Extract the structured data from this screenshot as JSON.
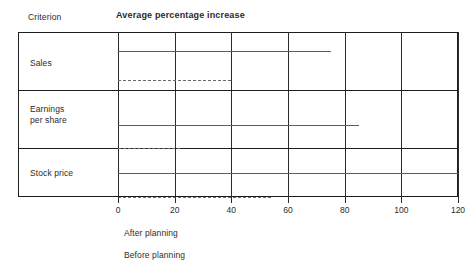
{
  "header": {
    "criterion_label": "Criterion",
    "series_label": "Average percentage increase"
  },
  "legend": {
    "after": "After planning",
    "before": "Before planning"
  },
  "chart_data": {
    "type": "bar",
    "orientation": "horizontal",
    "title": "Average percentage increase",
    "xlabel": "",
    "ylabel": "Criterion",
    "categories": [
      "Sales",
      "Earnings\nper share",
      "Stock price"
    ],
    "series": [
      {
        "name": "After planning",
        "style": "solid",
        "values": [
          75,
          85,
          120
        ]
      },
      {
        "name": "Before planning",
        "style": "dashed",
        "values": [
          40,
          22,
          54
        ]
      }
    ],
    "xlim": [
      0,
      120
    ],
    "xticks": [
      0,
      20,
      40,
      60,
      80,
      100,
      120
    ],
    "xticklabels": [
      "0",
      "20",
      "40",
      "60",
      "80",
      "100",
      "120"
    ],
    "grid": true,
    "grid_axis": "x",
    "legend_position": "below-left",
    "colors": {
      "frame": "#1d1d1d",
      "grid": "#2b2b2b",
      "after_bar": "#5c5c5c",
      "before_bar": "#6b6b6b",
      "text": "#2b2b2b",
      "background": "#ffffff"
    }
  }
}
